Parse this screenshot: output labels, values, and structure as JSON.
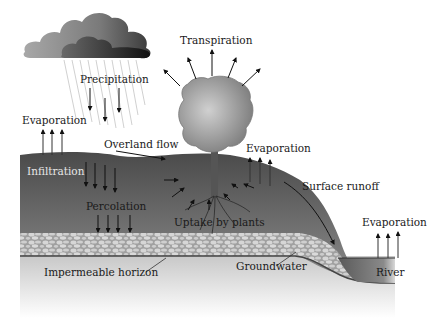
{
  "diagram": {
    "labels": {
      "transpiration": "Transpiration",
      "precipitation": "Precipitation",
      "evaporation_left": "Evaporation",
      "overland_flow": "Overland flow",
      "evaporation_middle": "Evaporation",
      "infiltration": "Infiltration",
      "surface_runoff": "Surface runoff",
      "percolation": "Percolation",
      "uptake_by_plants": "Uptake by plants",
      "evaporation_river": "Evaporation",
      "impermeable_horizon": "Impermeable horizon",
      "groundwater": "Groundwater",
      "river": "River"
    },
    "colors": {
      "soil_dark": "#555555",
      "soil_light": "#9a9a9a",
      "gravel": "#b8b8b8",
      "bedrock": "#d8d8d8",
      "river": "#6e6e6e",
      "tree_crown": "#a8a8a8",
      "cloud_light": "#9c9c9c",
      "cloud_dark": "#2a2a2a",
      "arrow": "#111111"
    }
  }
}
